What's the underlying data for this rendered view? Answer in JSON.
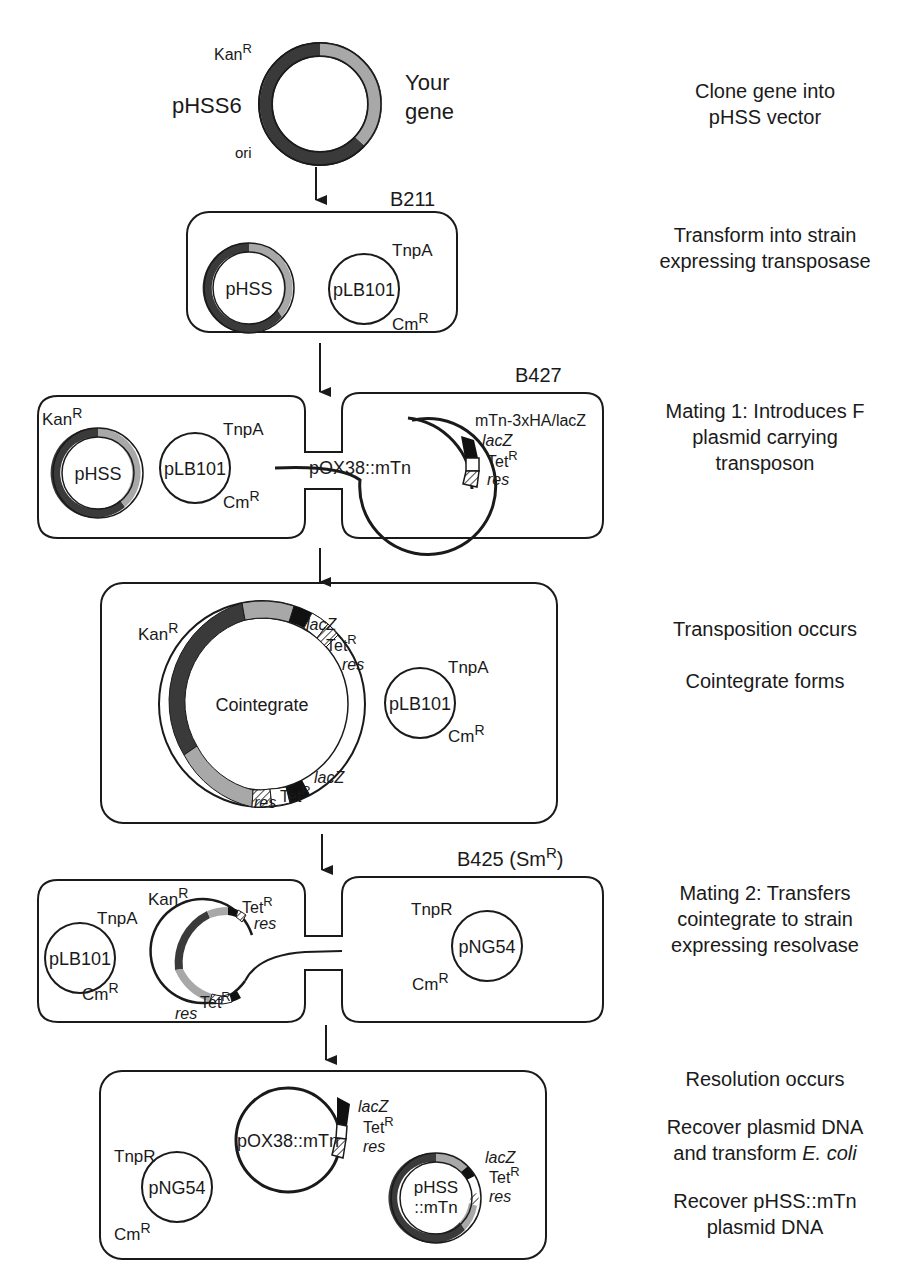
{
  "colors": {
    "dark_segment": "#3a3a3a",
    "light_segment": "#a8a8a8",
    "black_segment": "#111111",
    "outline": "#1a1a1a"
  },
  "steps": [
    {
      "line1": "Clone gene into",
      "line2": "pHSS vector"
    },
    {
      "line1": "Transform into strain",
      "line2": "expressing transposase"
    },
    {
      "line1": "Mating 1: Introduces F",
      "line2": "plasmid carrying",
      "line3": "transposon"
    },
    {
      "line1": "Transposition occurs",
      "line2": "Cointegrate forms"
    },
    {
      "line1": "Mating 2: Transfers",
      "line2": "cointegrate  to strain",
      "line3": "expressing resolvase"
    },
    {
      "line1": "Resolution occurs",
      "line2": "Recover plasmid DNA",
      "line3a": "and transform ",
      "line3b": "E. coli",
      "line4": "Recover pHSS::mTn",
      "line5": "plasmid DNA"
    }
  ],
  "stage0": {
    "plasmid": "pHSS6",
    "kan": "Kan",
    "sup": "R",
    "gene_line1": "Your",
    "gene_line2": "gene",
    "ori": "ori"
  },
  "stage1": {
    "strain": "B211",
    "pHSS": "pHSS",
    "pLB101": "pLB101",
    "tnpA": "TnpA",
    "cm": "Cm",
    "sup": "R"
  },
  "stage2": {
    "strain": "B427",
    "kan": "Kan",
    "pHSS": "pHSS",
    "pLB101": "pLB101",
    "tnpA": "TnpA",
    "cm": "Cm",
    "sup": "R",
    "mtn": "mTn-3xHA/lacZ",
    "lacZ": "lacZ",
    "tet": "Tet",
    "res": "res",
    "pOX": "pOX38::mTn"
  },
  "stage3": {
    "kan": "Kan",
    "sup": "R",
    "lacZ": "lacZ",
    "tet": "Tet",
    "res": "res",
    "cointegrate": "Cointegrate",
    "pLB101": "pLB101",
    "tnpA": "TnpA",
    "cm": "Cm"
  },
  "stage4": {
    "strain": "B425 (Sm",
    "strain_sup": "R",
    "strain_close": ")",
    "tnpA": "TnpA",
    "pLB101": "pLB101",
    "cm": "Cm",
    "kan": "Kan",
    "tet": "Tet",
    "res": "res",
    "sup": "R",
    "tnpR": "TnpR",
    "pNG54": "pNG54"
  },
  "stage5": {
    "tnpR": "TnpR",
    "pNG54": "pNG54",
    "cm": "Cm",
    "sup": "R",
    "pOX": "pOX38::mTn",
    "lacZ": "lacZ",
    "tet": "Tet",
    "res": "res",
    "pHSS_line1": "pHSS",
    "pHSS_line2": "::mTn"
  }
}
